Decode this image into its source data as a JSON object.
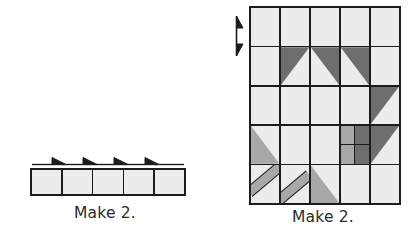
{
  "figure": {
    "type": "quilting-piecing-diagram",
    "colors": {
      "background": "#ffffff",
      "outline": "#1c1c1c",
      "light": "#ececec",
      "pale": "#e2e2e2",
      "medium": "#a8a8a8",
      "dark": "#6e6e6e",
      "caption_text": "#2b2b2b"
    }
  },
  "strip_unit": {
    "caption": "Make 2.",
    "columns": 5,
    "rows": 1,
    "patches": [
      {
        "fill": "light"
      },
      {
        "fill": "light"
      },
      {
        "fill": "light"
      },
      {
        "fill": "light"
      },
      {
        "fill": "light"
      }
    ],
    "pressing_arrows": {
      "count": 4,
      "direction": "right",
      "icon": "pressing-arrow-right-icon"
    }
  },
  "block_unit": {
    "caption": "Make 2.",
    "columns": 5,
    "rows": 5,
    "pressing_arrow": {
      "direction": "vertical-double",
      "icon": "pressing-arrow-updown-icon",
      "position": "left-edge"
    },
    "grid": [
      [
        {
          "name": "r1c1",
          "type": "square",
          "fill": "light"
        },
        {
          "name": "r1c2",
          "type": "square",
          "fill": "light"
        },
        {
          "name": "r1c3",
          "type": "square",
          "fill": "light"
        },
        {
          "name": "r1c4",
          "type": "square",
          "fill": "light"
        },
        {
          "name": "r1c5",
          "type": "square",
          "fill": "light"
        }
      ],
      [
        {
          "name": "r2c1",
          "type": "square",
          "fill": "light"
        },
        {
          "name": "r2c2",
          "type": "half-square-triangle",
          "base": "light",
          "tri": "dark",
          "corner": "tl"
        },
        {
          "name": "r2c3",
          "type": "half-square-triangle",
          "base": "light",
          "tri": "dark",
          "corner": "tr"
        },
        {
          "name": "r2c4",
          "type": "half-square-triangle",
          "base": "light",
          "tri": "dark",
          "corner": "tr"
        },
        {
          "name": "r2c5",
          "type": "square",
          "fill": "light"
        }
      ],
      [
        {
          "name": "r3c1",
          "type": "square",
          "fill": "light"
        },
        {
          "name": "r3c2",
          "type": "square",
          "fill": "medium"
        },
        {
          "name": "r3c3",
          "type": "square",
          "fill": "medium"
        },
        {
          "name": "r3c4",
          "type": "square",
          "fill": "dark"
        },
        {
          "name": "r3c5",
          "type": "half-square-triangle",
          "base": "light",
          "tri": "dark",
          "corner": "tl"
        }
      ],
      [
        {
          "name": "r4c1",
          "type": "half-square-triangle",
          "base": "light",
          "tri": "medium",
          "corner": "bl"
        },
        {
          "name": "r4c2",
          "type": "square",
          "fill": "medium"
        },
        {
          "name": "r4c3",
          "type": "square",
          "fill": "pale"
        },
        {
          "name": "r4c4",
          "type": "four-patch",
          "fills": [
            "medium",
            "dark",
            "medium",
            "dark"
          ]
        },
        {
          "name": "r4c5",
          "type": "half-square-triangle",
          "base": "light",
          "tri": "dark",
          "corner": "tl"
        }
      ],
      [
        {
          "name": "r5c1",
          "type": "stem-diagonal",
          "base": "light",
          "band": "medium"
        },
        {
          "name": "r5c2",
          "type": "stem-diagonal",
          "base": "light",
          "band": "medium"
        },
        {
          "name": "r5c3",
          "type": "half-square-triangle",
          "base": "light",
          "tri": "medium",
          "corner": "bl"
        },
        {
          "name": "r5c4",
          "type": "square",
          "fill": "light"
        },
        {
          "name": "r5c5",
          "type": "square",
          "fill": "light"
        }
      ]
    ]
  }
}
